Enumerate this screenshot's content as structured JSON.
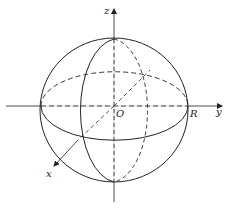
{
  "figure": {
    "type": "sphere-coordinate-diagram",
    "labels": {
      "z_axis": "z",
      "y_axis": "y",
      "x_axis": "x",
      "origin": "O",
      "radius": "R"
    },
    "colors": {
      "stroke": "#222222",
      "background": "#ffffff"
    }
  }
}
